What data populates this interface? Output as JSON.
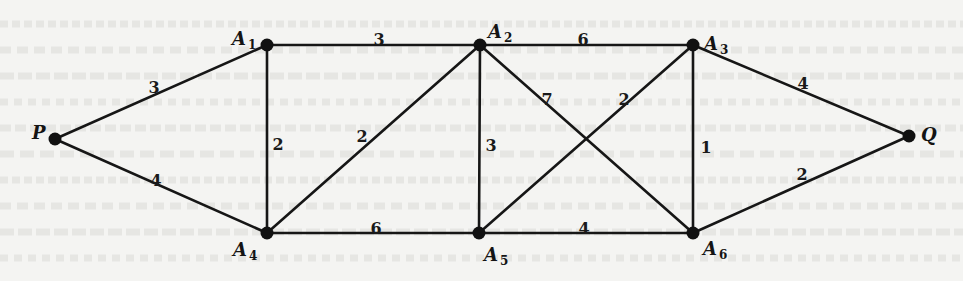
{
  "diagram": {
    "type": "weighted-undirected-graph",
    "background_color": "#f4f4f2",
    "ink_color": "#161616",
    "nodes": [
      {
        "id": "P",
        "label": "P",
        "sub": "",
        "x": 55,
        "y": 139,
        "lx": 32,
        "ly": 134
      },
      {
        "id": "A1",
        "label": "A",
        "sub": "1",
        "x": 267,
        "y": 45,
        "lx": 232,
        "ly": 40
      },
      {
        "id": "A2",
        "label": "A",
        "sub": "2",
        "x": 480,
        "y": 45,
        "lx": 488,
        "ly": 33
      },
      {
        "id": "A3",
        "label": "A",
        "sub": "3",
        "x": 693,
        "y": 45,
        "lx": 704,
        "ly": 45
      },
      {
        "id": "A4",
        "label": "A",
        "sub": "4",
        "x": 267,
        "y": 233,
        "lx": 233,
        "ly": 251
      },
      {
        "id": "A5",
        "label": "A",
        "sub": "5",
        "x": 479,
        "y": 233,
        "lx": 484,
        "ly": 256
      },
      {
        "id": "A6",
        "label": "A",
        "sub": "6",
        "x": 693,
        "y": 233,
        "lx": 703,
        "ly": 250
      },
      {
        "id": "Q",
        "label": "Q",
        "sub": "",
        "x": 909,
        "y": 136,
        "lx": 921,
        "ly": 136
      }
    ],
    "edges": [
      {
        "from": "P",
        "to": "A1",
        "weight": "3",
        "wx": 154,
        "wy": 88
      },
      {
        "from": "P",
        "to": "A4",
        "weight": "4",
        "wx": 156,
        "wy": 181
      },
      {
        "from": "A1",
        "to": "A2",
        "weight": "3",
        "wx": 379,
        "wy": 40
      },
      {
        "from": "A1",
        "to": "A4",
        "weight": "2",
        "wx": 278,
        "wy": 145
      },
      {
        "from": "A4",
        "to": "A2",
        "weight": "2",
        "wx": 362,
        "wy": 137
      },
      {
        "from": "A4",
        "to": "A5",
        "weight": "6",
        "wx": 376,
        "wy": 229
      },
      {
        "from": "A2",
        "to": "A3",
        "weight": "6",
        "wx": 583,
        "wy": 40
      },
      {
        "from": "A2",
        "to": "A5",
        "weight": "3",
        "wx": 491,
        "wy": 146
      },
      {
        "from": "A2",
        "to": "A6",
        "weight": "7",
        "wx": 547,
        "wy": 100
      },
      {
        "from": "A5",
        "to": "A3",
        "weight": "2",
        "wx": 624,
        "wy": 100
      },
      {
        "from": "A5",
        "to": "A6",
        "weight": "4",
        "wx": 584,
        "wy": 229
      },
      {
        "from": "A3",
        "to": "A6",
        "weight": "1",
        "wx": 706,
        "wy": 148
      },
      {
        "from": "A3",
        "to": "Q",
        "weight": "4",
        "wx": 803,
        "wy": 84
      },
      {
        "from": "A6",
        "to": "Q",
        "weight": "2",
        "wx": 802,
        "wy": 175
      }
    ]
  }
}
